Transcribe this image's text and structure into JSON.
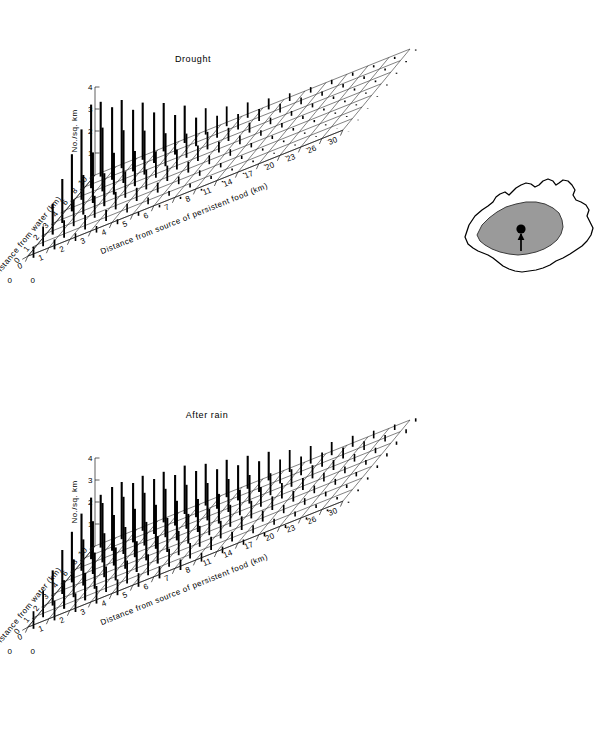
{
  "figure": {
    "background": "#ffffff",
    "ink": "#000000",
    "width": 614,
    "height": 741
  },
  "panels": [
    {
      "id": "drought",
      "title": "Drought",
      "z_axis": {
        "label": "No./sq. km",
        "ticks": [
          "1",
          "2",
          "3",
          "4"
        ],
        "min": 0,
        "max": 4
      },
      "y_axis": {
        "label": "Distance from water (km)",
        "ticks": [
          "10",
          "8",
          "6",
          "4",
          "3",
          "2",
          "1",
          "0"
        ]
      },
      "x_axis": {
        "label": "Distance from source of persistent food (km)",
        "ticks": [
          "0",
          "1",
          "2",
          "3",
          "4",
          "5",
          "6",
          "7",
          "8",
          "11",
          "14",
          "17",
          "20",
          "23",
          "26",
          "30"
        ]
      }
    },
    {
      "id": "afterrain",
      "title": "After rain",
      "z_axis": {
        "label": "No./sq. km",
        "ticks": [
          "1",
          "2",
          "3",
          "4"
        ],
        "min": 0,
        "max": 4
      },
      "y_axis": {
        "label": "Distance from water (km)",
        "ticks": [
          "10",
          "8",
          "6",
          "4",
          "3",
          "2",
          "1",
          "0"
        ]
      },
      "x_axis": {
        "label": "Distance from source of persistent food (km)",
        "ticks": [
          "0",
          "1",
          "2",
          "3",
          "4",
          "5",
          "6",
          "7",
          "8",
          "11",
          "14",
          "17",
          "20",
          "23",
          "26",
          "30"
        ]
      }
    }
  ],
  "inset_map": {
    "name": "australia-map",
    "shaded_region_color": "#9a9a9a",
    "outline_color": "#000000",
    "site_marker": "filled-circle-with-arrow"
  },
  "chart_data": [
    {
      "type": "bar",
      "title": "Drought",
      "subtitle": "",
      "xlabel": "Distance from source of persistent food (km)",
      "ylabel": "Distance from water (km)",
      "zlabel": "No./sq. km",
      "projection": "3d-surface-mesh",
      "grid": true,
      "legend": "none",
      "zlim": [
        0,
        4
      ],
      "x": [
        0,
        1,
        2,
        3,
        4,
        5,
        6,
        7,
        8,
        11,
        14,
        17,
        20,
        23,
        26,
        30
      ],
      "y": [
        0,
        1,
        2,
        3,
        4,
        6,
        8,
        10
      ],
      "values": [
        [
          3.4,
          3.1,
          2.6,
          2.2,
          1.7,
          1.2,
          0.9,
          0.7,
          0.5,
          0.35,
          0.25,
          0.2,
          0.15,
          0.1,
          0.1,
          0.05
        ],
        [
          3.8,
          3.3,
          2.8,
          2.3,
          1.8,
          1.3,
          1.0,
          0.7,
          0.55,
          0.4,
          0.3,
          0.2,
          0.15,
          0.12,
          0.1,
          0.05
        ],
        [
          3.2,
          2.9,
          2.4,
          2.0,
          1.5,
          1.1,
          0.8,
          0.6,
          0.45,
          0.3,
          0.22,
          0.18,
          0.12,
          0.1,
          0.08,
          0.05
        ],
        [
          2.6,
          2.3,
          1.9,
          1.6,
          1.2,
          0.9,
          0.7,
          0.5,
          0.4,
          0.25,
          0.2,
          0.15,
          0.1,
          0.08,
          0.06,
          0.04
        ],
        [
          2.0,
          1.8,
          1.5,
          1.2,
          0.9,
          0.7,
          0.5,
          0.4,
          0.3,
          0.2,
          0.15,
          0.12,
          0.1,
          0.06,
          0.05,
          0.03
        ],
        [
          1.4,
          1.2,
          1.0,
          0.8,
          0.6,
          0.45,
          0.35,
          0.25,
          0.2,
          0.15,
          0.1,
          0.08,
          0.06,
          0.05,
          0.04,
          0.02
        ],
        [
          0.9,
          0.8,
          0.65,
          0.5,
          0.4,
          0.3,
          0.22,
          0.18,
          0.14,
          0.1,
          0.08,
          0.05,
          0.04,
          0.03,
          0.02,
          0.02
        ],
        [
          0.5,
          0.45,
          0.35,
          0.3,
          0.22,
          0.18,
          0.12,
          0.1,
          0.08,
          0.05,
          0.04,
          0.03,
          0.02,
          0.02,
          0.01,
          0.01
        ]
      ]
    },
    {
      "type": "bar",
      "title": "After rain",
      "subtitle": "",
      "xlabel": "Distance from source of persistent food (km)",
      "ylabel": "Distance from water (km)",
      "zlabel": "No./sq. km",
      "projection": "3d-surface-mesh",
      "grid": true,
      "legend": "none",
      "zlim": [
        0,
        4
      ],
      "x": [
        0,
        1,
        2,
        3,
        4,
        5,
        6,
        7,
        8,
        11,
        14,
        17,
        20,
        23,
        26,
        30
      ],
      "y": [
        0,
        1,
        2,
        3,
        4,
        6,
        8,
        10
      ],
      "values": [
        [
          2.4,
          2.6,
          2.5,
          2.3,
          2.2,
          1.9,
          1.7,
          1.5,
          1.3,
          1.0,
          0.8,
          0.6,
          0.5,
          0.35,
          0.25,
          0.15
        ],
        [
          2.8,
          2.9,
          2.7,
          2.5,
          2.3,
          2.1,
          1.8,
          1.6,
          1.4,
          1.1,
          0.85,
          0.65,
          0.5,
          0.4,
          0.3,
          0.18
        ],
        [
          2.6,
          2.7,
          2.6,
          2.4,
          2.2,
          2.0,
          1.7,
          1.5,
          1.3,
          1.0,
          0.8,
          0.6,
          0.45,
          0.35,
          0.25,
          0.15
        ],
        [
          2.3,
          2.4,
          2.3,
          2.2,
          2.0,
          1.8,
          1.5,
          1.35,
          1.15,
          0.9,
          0.7,
          0.55,
          0.4,
          0.3,
          0.22,
          0.14
        ],
        [
          2.0,
          2.1,
          2.0,
          1.9,
          1.75,
          1.55,
          1.35,
          1.2,
          1.0,
          0.8,
          0.62,
          0.48,
          0.35,
          0.27,
          0.2,
          0.12
        ],
        [
          1.6,
          1.7,
          1.65,
          1.5,
          1.4,
          1.25,
          1.1,
          0.95,
          0.8,
          0.62,
          0.5,
          0.38,
          0.3,
          0.22,
          0.16,
          0.1
        ],
        [
          1.2,
          1.3,
          1.25,
          1.15,
          1.05,
          0.95,
          0.82,
          0.7,
          0.6,
          0.45,
          0.36,
          0.28,
          0.22,
          0.16,
          0.12,
          0.08
        ],
        [
          0.8,
          0.9,
          0.85,
          0.8,
          0.72,
          0.62,
          0.55,
          0.48,
          0.4,
          0.3,
          0.24,
          0.18,
          0.14,
          0.1,
          0.08,
          0.05
        ]
      ]
    }
  ]
}
